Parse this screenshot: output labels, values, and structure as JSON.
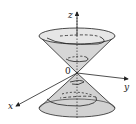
{
  "diagram": {
    "labels": {
      "z": "z",
      "y": "y",
      "x": "x",
      "origin": "0"
    },
    "colors": {
      "cone_fill": "#cfcfcf",
      "cone_fill_light": "#e4e4e4",
      "stroke": "#222222",
      "background": "#ffffff"
    }
  }
}
